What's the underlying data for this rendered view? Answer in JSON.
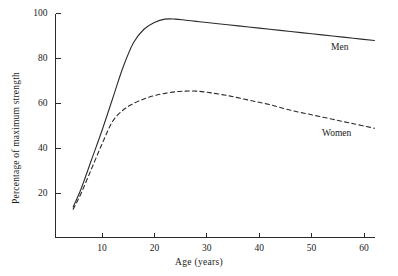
{
  "chart_data": {
    "type": "line",
    "title": "",
    "subtitle": "",
    "xlabel": "Age (years)",
    "ylabel": "Percentage of maximum strength",
    "xlim": [
      0,
      64
    ],
    "ylim": [
      0,
      100
    ],
    "xticks": [
      10,
      20,
      30,
      40,
      50,
      60
    ],
    "xtick_labels": [
      "10",
      "20",
      "30",
      "40",
      "50",
      "60"
    ],
    "yticks": [
      20,
      40,
      60,
      80,
      100
    ],
    "ytick_labels": [
      "20",
      "40",
      "60",
      "80",
      "100"
    ],
    "grid": false,
    "legend_position": "inline-annotation",
    "line_color": "#2b2b2b",
    "series": [
      {
        "name": "Men",
        "style": "solid",
        "label_text": "Men",
        "x": [
          4.5,
          6,
          8,
          10,
          12,
          14,
          16,
          18,
          20,
          22,
          24,
          26,
          28,
          30,
          34,
          38,
          42,
          46,
          50,
          54,
          58,
          62
        ],
        "values": [
          14,
          22,
          35,
          48,
          62,
          76,
          87,
          93,
          96,
          97.5,
          97.5,
          97,
          96.5,
          96,
          95,
          94,
          93,
          92,
          91,
          90,
          89,
          88
        ]
      },
      {
        "name": "Women",
        "style": "dashed",
        "label_text": "Women",
        "x": [
          4.5,
          6,
          8,
          10,
          12,
          14,
          16,
          18,
          20,
          22,
          24,
          26,
          28,
          30,
          34,
          38,
          42,
          46,
          50,
          54,
          58,
          62
        ],
        "values": [
          13,
          20,
          31,
          42,
          52,
          57,
          60,
          62,
          63.5,
          64.5,
          65.2,
          65.5,
          65.5,
          65,
          63.5,
          61.5,
          59.5,
          57,
          55,
          53,
          51,
          49
        ]
      }
    ],
    "annotations": [
      {
        "text": "Men",
        "series": "Men",
        "x": 56,
        "y": 90
      },
      {
        "text": "Women",
        "series": "Women",
        "x": 53,
        "y": 55
      }
    ]
  }
}
